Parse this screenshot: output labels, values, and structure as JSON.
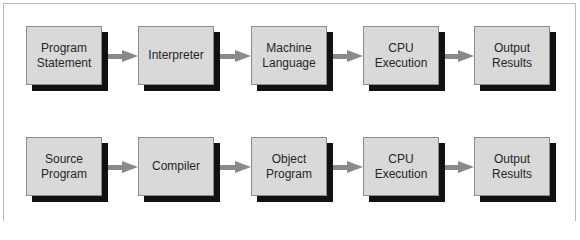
{
  "diagram": {
    "type": "flowchart",
    "direction": "left-to-right",
    "colors": {
      "box_face": "#d9d9d9",
      "box_shadow": "#111111",
      "box_border": "#8c8c8c",
      "arrow": "#8a8a8a",
      "text": "#262626",
      "frame": "#b8b8b8"
    },
    "rows": [
      {
        "name": "interpreter-flow",
        "nodes": [
          {
            "label": "Program\nStatement"
          },
          {
            "label": "Interpreter"
          },
          {
            "label": "Machine\nLanguage"
          },
          {
            "label": "CPU\nExecution"
          },
          {
            "label": "Output\nResults"
          }
        ]
      },
      {
        "name": "compiler-flow",
        "nodes": [
          {
            "label": "Source\nProgram"
          },
          {
            "label": "Compiler"
          },
          {
            "label": "Object\nProgram"
          },
          {
            "label": "CPU\nExecution"
          },
          {
            "label": "Output\nResults"
          }
        ]
      }
    ],
    "edges": [
      {
        "row": 0,
        "from": "Program Statement",
        "to": "Interpreter"
      },
      {
        "row": 0,
        "from": "Interpreter",
        "to": "Machine Language"
      },
      {
        "row": 0,
        "from": "Machine Language",
        "to": "CPU Execution"
      },
      {
        "row": 0,
        "from": "CPU Execution",
        "to": "Output Results"
      },
      {
        "row": 1,
        "from": "Source Program",
        "to": "Compiler"
      },
      {
        "row": 1,
        "from": "Compiler",
        "to": "Object Program"
      },
      {
        "row": 1,
        "from": "Object Program",
        "to": "CPU Execution"
      },
      {
        "row": 1,
        "from": "CPU Execution",
        "to": "Output Results"
      }
    ]
  }
}
